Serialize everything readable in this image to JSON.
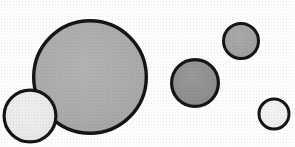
{
  "figure": {
    "title": "Five outlined circles of varying size and gray fill",
    "background_color": "#fdfdfc",
    "width": 295,
    "height": 147,
    "outline_color": "#151515",
    "caption": ""
  },
  "chart_data": {
    "type": "scatter",
    "title": "Five outlined circles of varying size and gray fill",
    "subtitle": "",
    "xlabel": "",
    "ylabel": "",
    "xlim": [
      0,
      295
    ],
    "ylim": [
      0,
      147
    ],
    "grid": false,
    "legend": null,
    "annotations": [],
    "tick_labels": {
      "x": [],
      "y": []
    },
    "series": [
      {
        "name": "circles",
        "marker": "circle",
        "points": [
          {
            "label": "large-gray-circle",
            "x": 90,
            "y": 77,
            "diameter": 116,
            "radius": 58,
            "fill": "#ababab",
            "stroke": "#151515",
            "stroke_width": 3.4,
            "z": 1
          },
          {
            "label": "left-light-circle",
            "x": 30,
            "y": 116,
            "diameter": 55,
            "radius": 27.5,
            "fill": "#e9e9e7",
            "stroke": "#151515",
            "stroke_width": 3.2,
            "z": 2
          },
          {
            "label": "middle-dark-gray-circle",
            "x": 195,
            "y": 83,
            "diameter": 50,
            "radius": 25,
            "fill": "#909090",
            "stroke": "#151515",
            "stroke_width": 3.2,
            "z": 1
          },
          {
            "label": "top-right-gray-circle",
            "x": 241,
            "y": 41,
            "diameter": 38,
            "radius": 19,
            "fill": "#a2a2a2",
            "stroke": "#151515",
            "stroke_width": 3.0,
            "z": 1
          },
          {
            "label": "bottom-right-light-circle",
            "x": 274,
            "y": 114,
            "diameter": 33,
            "radius": 16.5,
            "fill": "#eeeeec",
            "stroke": "#151515",
            "stroke_width": 3.0,
            "z": 1
          }
        ]
      }
    ],
    "counts": {
      "total_circles": 5,
      "light_filled": 2,
      "gray_filled": 3
    }
  }
}
